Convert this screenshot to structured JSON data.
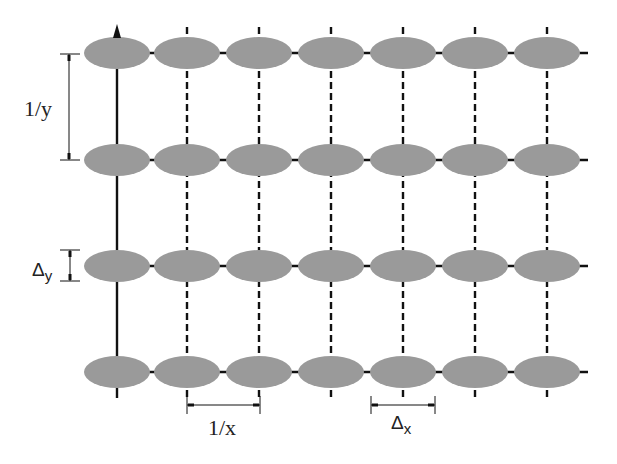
{
  "diagram": {
    "title": "",
    "grid": {
      "columns_x": [
        117,
        187,
        259,
        331,
        403,
        475,
        547
      ],
      "rows_y": [
        53,
        160,
        266,
        372
      ],
      "ellipse_rx": 33,
      "ellipse_ry": 16,
      "ellipse_color": "#9a9a9a",
      "line_color": "#111111"
    },
    "labels": {
      "period_y": "1/y",
      "delta_y_symbol": "Δ",
      "delta_y_sub": "y",
      "period_x": "1/x",
      "delta_x_symbol": "Δ",
      "delta_x_sub": "x"
    }
  }
}
